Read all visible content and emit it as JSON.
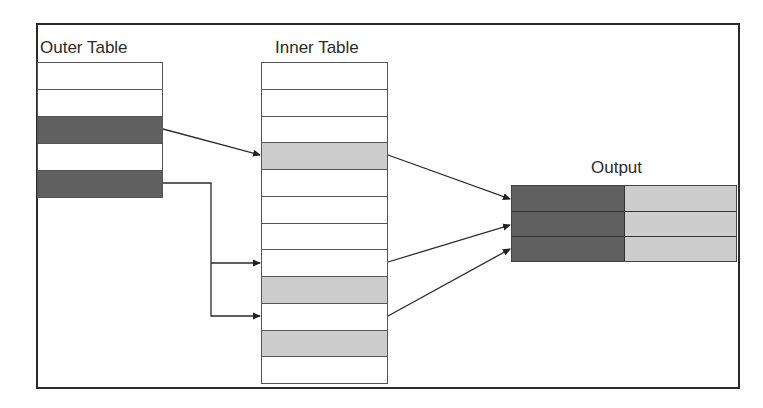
{
  "diagram": {
    "outer_table": {
      "title": "Outer Table",
      "rows": [
        {
          "index": 1,
          "highlighted": false
        },
        {
          "index": 2,
          "highlighted": false
        },
        {
          "index": 3,
          "highlighted": true
        },
        {
          "index": 4,
          "highlighted": false
        },
        {
          "index": 5,
          "highlighted": true
        }
      ]
    },
    "inner_table": {
      "title": "Inner Table",
      "rows": [
        {
          "index": 1,
          "highlighted": false
        },
        {
          "index": 2,
          "highlighted": false
        },
        {
          "index": 3,
          "highlighted": false
        },
        {
          "index": 4,
          "highlighted": true
        },
        {
          "index": 5,
          "highlighted": false
        },
        {
          "index": 6,
          "highlighted": false
        },
        {
          "index": 7,
          "highlighted": false
        },
        {
          "index": 8,
          "highlighted": false
        },
        {
          "index": 9,
          "highlighted": true
        },
        {
          "index": 10,
          "highlighted": false
        },
        {
          "index": 11,
          "highlighted": true
        },
        {
          "index": 12,
          "highlighted": false
        }
      ]
    },
    "output_table": {
      "title": "Output",
      "rows": 3,
      "columns": [
        "outer",
        "inner"
      ]
    },
    "edges": [
      {
        "from": "outer_table.row3",
        "to": "inner_table.row4",
        "style": "straight"
      },
      {
        "from": "outer_table.row5",
        "to": "inner_table.row9",
        "style": "elbow"
      },
      {
        "from": "outer_table.row5",
        "to": "inner_table.row11",
        "style": "elbow"
      },
      {
        "from": "inner_table.row4",
        "to": "output_table.row1",
        "style": "straight"
      },
      {
        "from": "inner_table.row9",
        "to": "output_table.row2",
        "style": "straight"
      },
      {
        "from": "inner_table.row11",
        "to": "output_table.row3",
        "style": "straight"
      }
    ],
    "colors": {
      "outer_match": "#6b6b6b",
      "inner_match": "#d4d4d4",
      "border": "#2a2a2a"
    }
  }
}
